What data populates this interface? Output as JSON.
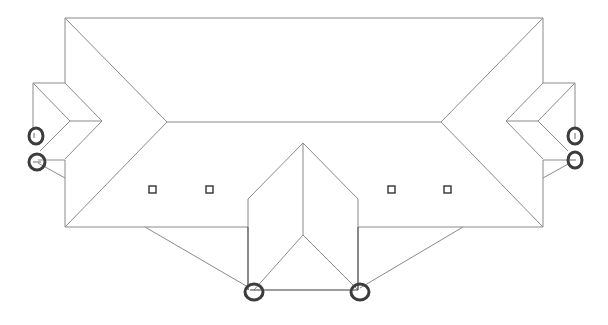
{
  "diagram": {
    "type": "roof-plan",
    "colors": {
      "background": "#ffffff",
      "roof_line": "#8a8a8a",
      "eave_line": "#3a3a3a",
      "downspout": "#3c3c3c",
      "vent": "#333333"
    },
    "roof_sections": [
      {
        "name": "main-hip-roof"
      },
      {
        "name": "left-wing-roof"
      },
      {
        "name": "right-wing-roof"
      },
      {
        "name": "front-projecting-wing-roof"
      }
    ],
    "vents": [
      {
        "id": "vent-1",
        "x": 153,
        "y": 190
      },
      {
        "id": "vent-2",
        "x": 210,
        "y": 190
      },
      {
        "id": "vent-3",
        "x": 391,
        "y": 190
      },
      {
        "id": "vent-4",
        "x": 448,
        "y": 190
      }
    ],
    "downspouts": [
      {
        "id": "downspout-left-upper",
        "x": 36,
        "y": 136
      },
      {
        "id": "downspout-left-lower",
        "x": 36,
        "y": 162
      },
      {
        "id": "downspout-front-left",
        "x": 254,
        "y": 292
      },
      {
        "id": "downspout-front-right",
        "x": 360,
        "y": 292
      },
      {
        "id": "downspout-right-upper",
        "x": 575,
        "y": 136
      },
      {
        "id": "downspout-right-lower",
        "x": 575,
        "y": 160
      }
    ]
  }
}
